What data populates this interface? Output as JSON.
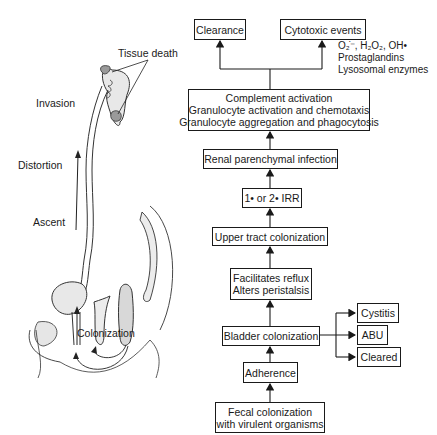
{
  "flowchart": {
    "clearance": "Clearance",
    "cytotoxic": "Cytotoxic events",
    "mediators": [
      "O₂̇⁻, H₂O₂, OH•",
      "Prostaglandins",
      "Lysosomal enzymes"
    ],
    "complement": [
      "Complement activation",
      "Granulocyte activation and chemotaxis",
      "Granulocyte aggregation and phagocytosis"
    ],
    "renal": "Renal parenchymal infection",
    "irr": "1• or 2• IRR",
    "upper_tract": "Upper tract colonization",
    "reflux": [
      "Facilitates reflux",
      "Alters peristalsis"
    ],
    "bladder": "Bladder colonization",
    "outcomes": [
      "Cystitis",
      "ABU",
      "Cleared"
    ],
    "adherence": "Adherence",
    "fecal": [
      "Fecal colonization",
      "with virulent organisms"
    ]
  },
  "illustration": {
    "tissue_death": "Tissue death",
    "invasion": "Invasion",
    "distortion": "Distortion",
    "ascent": "Ascent",
    "colonization": "Colonization"
  }
}
